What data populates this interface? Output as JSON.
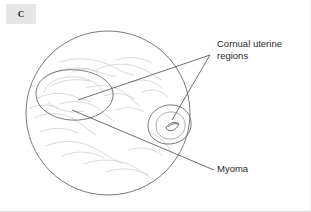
{
  "figure": {
    "panel_tag": "C",
    "panel_tag_bg": "#e6e6e6",
    "background": "#ffffff",
    "view_type": "hysteroscopic view of uterine cavity",
    "outline_color": "#6b6b6b",
    "texture_color": "#c9c9c9",
    "leader_color": "#4a4a4a",
    "text_color": "#2b2b2b"
  },
  "labels": {
    "cornual": {
      "line1": "Cornual uterine",
      "line2": "regions"
    },
    "myoma": {
      "line1": "Myoma"
    }
  },
  "annotations": {
    "cornual_leader_vertex": "210,55",
    "cornual_leader_target_left": "78,100",
    "cornual_leader_target_right": "172,120",
    "myoma_leader_start": "72,110",
    "myoma_leader_end": "214,170"
  },
  "geometry": {
    "cavity_circle_center_x": 108,
    "cavity_circle_center_y": 113,
    "cavity_circle_radius": 82
  }
}
